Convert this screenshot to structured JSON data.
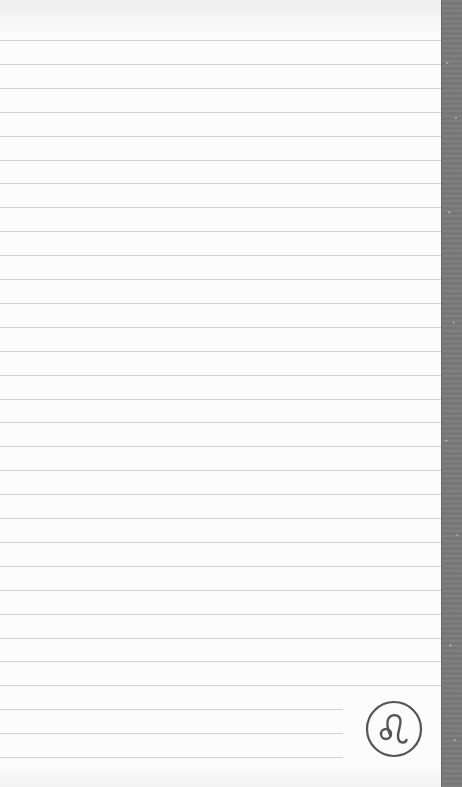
{
  "page": {
    "type": "lined-notebook-page",
    "paper_color": "#fcfcfc",
    "rule_color": "#d2d2d2",
    "spine_color": "#7b7b7b",
    "rule_count": 31,
    "rule_first_y": 40,
    "rule_spacing": 23.9,
    "short_rule_count": 3,
    "short_rule_width": 343,
    "full_rule_width": 441
  },
  "emblem": {
    "icon": "leo-zodiac-icon",
    "glyph": "♌",
    "stroke_color": "#555555"
  }
}
